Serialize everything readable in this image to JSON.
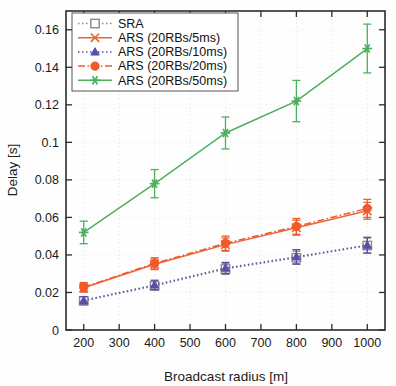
{
  "chart_data": {
    "type": "line",
    "title": "",
    "xlabel": "Broadcast radius [m]",
    "ylabel": "Delay [s]",
    "x": [
      200,
      400,
      600,
      800,
      1000
    ],
    "xlim": [
      150,
      1050
    ],
    "ylim": [
      0,
      0.17
    ],
    "xticks": [
      200,
      300,
      400,
      500,
      600,
      700,
      800,
      900,
      1000
    ],
    "xtick_labels": [
      "200",
      "300",
      "400",
      "500",
      "600",
      "700",
      "800",
      "900",
      "1000"
    ],
    "yticks": [
      0,
      0.02,
      0.04,
      0.06,
      0.08,
      0.1,
      0.12,
      0.14,
      0.16
    ],
    "ytick_labels": [
      "0",
      "0.02",
      "0.04",
      "0.06",
      "0.08",
      "0.1",
      "0.12",
      "0.14",
      "0.16"
    ],
    "grid": true,
    "legend_position": "upper-left",
    "series": [
      {
        "name": "SRA",
        "color": "#8a8a8a",
        "marker": "square",
        "linestyle": "dotted",
        "values": [
          0.0155,
          0.0235,
          0.0325,
          0.0385,
          0.045
        ],
        "errors": [
          0.0018,
          0.0022,
          0.0028,
          0.0035,
          0.004
        ]
      },
      {
        "name": "ARS (20RBs/5ms)",
        "color": "#e8663c",
        "marker": "x",
        "linestyle": "solid",
        "values": [
          0.0225,
          0.035,
          0.0455,
          0.0545,
          0.0635
        ],
        "errors": [
          0.0022,
          0.0028,
          0.0035,
          0.004,
          0.0045
        ]
      },
      {
        "name": "ARS (20RBs/10ms)",
        "color": "#5b4ea8",
        "marker": "triangle",
        "linestyle": "dotted",
        "values": [
          0.0158,
          0.024,
          0.033,
          0.039,
          0.0452
        ],
        "errors": [
          0.002,
          0.0025,
          0.003,
          0.0038,
          0.0042
        ]
      },
      {
        "name": "ARS (20RBs/20ms)",
        "color": "#f05a28",
        "marker": "circle",
        "linestyle": "dashdot",
        "values": [
          0.0228,
          0.0355,
          0.0462,
          0.0552,
          0.0648
        ],
        "errors": [
          0.0025,
          0.003,
          0.0038,
          0.0042,
          0.0048
        ]
      },
      {
        "name": "ARS (20RBs/50ms)",
        "color": "#4bb05c",
        "marker": "asterisk",
        "linestyle": "solid",
        "values": [
          0.052,
          0.078,
          0.105,
          0.122,
          0.15
        ],
        "errors": [
          0.006,
          0.0075,
          0.0085,
          0.011,
          0.013
        ]
      }
    ]
  },
  "axes": {
    "x_title": "Broadcast radius [m]",
    "y_title": "Delay [s]"
  }
}
